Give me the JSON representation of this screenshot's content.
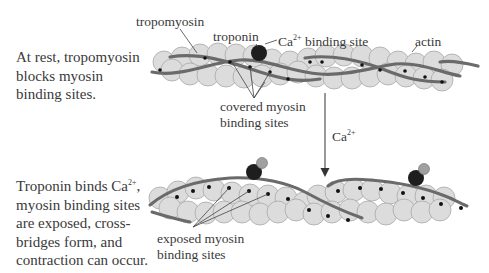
{
  "panels": {
    "rest": {
      "description_lines": [
        "At rest, tropomyosin",
        "blocks myosin",
        "binding sites."
      ],
      "labels": {
        "tropomyosin": "tropomyosin",
        "troponin": "troponin",
        "ca_site_prefix": "Ca",
        "ca_site_sup": "2+",
        "ca_site_suffix": " binding site",
        "actin": "actin",
        "covered_line1": "covered myosin",
        "covered_line2": "binding sites"
      }
    },
    "transition": {
      "arrow_label_prefix": "Ca",
      "arrow_label_sup": "2+"
    },
    "active": {
      "description_line1_prefix": "Troponin binds Ca",
      "description_line1_sup": "2+",
      "description_line1_suffix": ",",
      "description_lines": [
        "myosin binding sites",
        "are exposed, cross-",
        "bridges form, and",
        "contraction can occur."
      ],
      "labels": {
        "exposed_line1": "exposed myosin",
        "exposed_line2": "binding sites"
      }
    }
  },
  "colors": {
    "actin_fill": "#dcdcdc",
    "actin_stroke": "#a8a8a8",
    "tropomyosin": "#6a6a6a",
    "troponin": "#1e1e1e",
    "calcium": "#a0a0a0",
    "binding_site": "#111111",
    "text": "#3a3a3a"
  }
}
